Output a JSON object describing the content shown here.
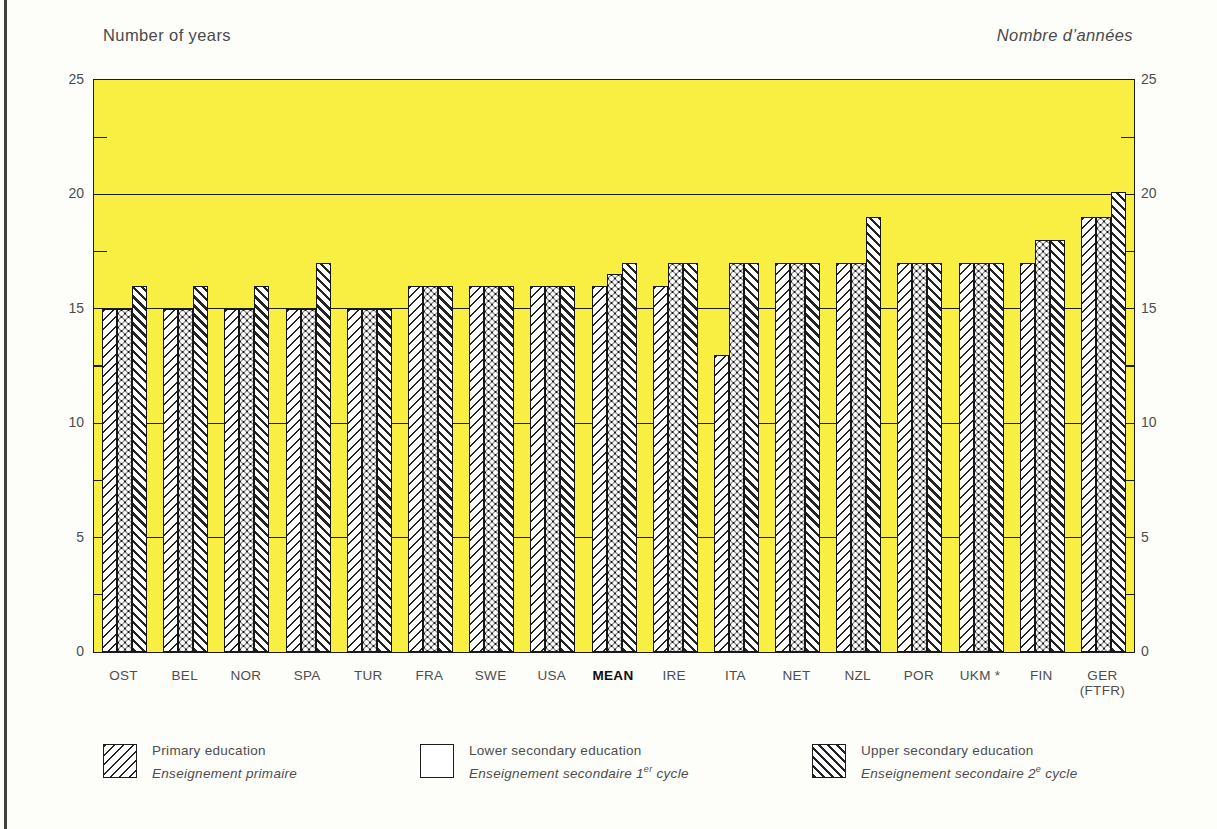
{
  "titles": {
    "left": "Number of years",
    "right": "Nombre d’années"
  },
  "chart_data": {
    "type": "bar",
    "categories": [
      "OST",
      "BEL",
      "NOR",
      "SPA",
      "TUR",
      "FRA",
      "SWE",
      "USA",
      "MEAN",
      "IRE",
      "ITA",
      "NET",
      "NZL",
      "POR",
      "UKM *",
      "FIN",
      "GER\n(FTFR)"
    ],
    "bold_category": "MEAN",
    "series": [
      {
        "name": "Primary education",
        "name_fr": "Enseignement primaire",
        "pattern": "diagonal-up",
        "values": [
          15,
          15,
          15,
          15,
          15,
          16,
          16,
          16,
          16,
          16,
          13,
          17,
          17,
          17,
          17,
          17,
          19
        ]
      },
      {
        "name": "Lower secondary education",
        "name_fr": "Enseignement secondaire 1er cycle",
        "pattern": "dots",
        "values": [
          15,
          15,
          15,
          15,
          15,
          16,
          16,
          16,
          16.5,
          17,
          17,
          17,
          17,
          17,
          17,
          18,
          19
        ]
      },
      {
        "name": "Upper secondary education",
        "name_fr": "Enseignement secondaire 2e cycle",
        "pattern": "diagonal-down",
        "values": [
          16,
          16,
          16,
          17,
          15,
          16,
          16,
          16,
          17,
          17,
          17,
          17,
          19,
          17,
          17,
          18,
          20.1
        ]
      }
    ],
    "ylabel_left": "Number of years",
    "ylabel_right": "Nombre d’années",
    "xlabel": "",
    "ylim": [
      0,
      25
    ],
    "yticks": [
      0,
      5,
      10,
      15,
      20,
      25
    ],
    "minor_yticks": [
      2.5,
      7.5,
      12.5,
      17.5,
      22.5
    ],
    "gridlines": [
      5,
      10,
      15,
      20
    ],
    "grid": "horizontal lines at multiples of 5, drawn behind bars",
    "legend_position": "bottom",
    "plot_background": "#F9EF43",
    "bar_outline": "#161616"
  },
  "legend": {
    "items": [
      {
        "label_en": "Primary education",
        "fr_pre": "Enseignement primaire",
        "fr_sup": "",
        "fr_post": "",
        "pattern": "diagonal-up"
      },
      {
        "label_en": "Lower secondary education",
        "fr_pre": "Enseignement secondaire 1",
        "fr_sup": "er",
        "fr_post": " cycle",
        "pattern": "dots"
      },
      {
        "label_en": "Upper secondary education",
        "fr_pre": "Enseignement secondaire 2",
        "fr_sup": "e",
        "fr_post": " cycle",
        "pattern": "diagonal-down"
      }
    ]
  }
}
